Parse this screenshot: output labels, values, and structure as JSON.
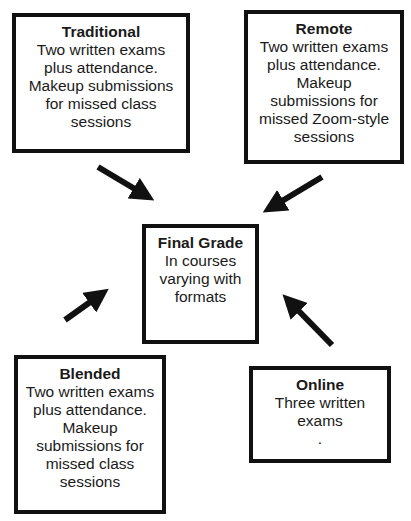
{
  "nodes": {
    "traditional": {
      "title": "Traditional",
      "body": "Two written exams\nplus attendance.\nMakeup submissions\nfor missed class\nsessions"
    },
    "remote": {
      "title": "Remote",
      "body": "Two written exams\nplus attendance.\nMakeup\nsubmissions for\nmissed Zoom-style\nsessions"
    },
    "final": {
      "title": "Final Grade",
      "body": "In courses\nvarying with\nformats"
    },
    "blended": {
      "title": "Blended",
      "body": "Two written exams\nplus attendance.\nMakeup\nsubmissions for\nmissed class\nsessions"
    },
    "online": {
      "title": "Online",
      "body": "Three written\nexams\n."
    }
  },
  "edges": [
    {
      "from": "traditional",
      "to": "final"
    },
    {
      "from": "remote",
      "to": "final"
    },
    {
      "from": "blended",
      "to": "final"
    },
    {
      "from": "online",
      "to": "final"
    }
  ]
}
